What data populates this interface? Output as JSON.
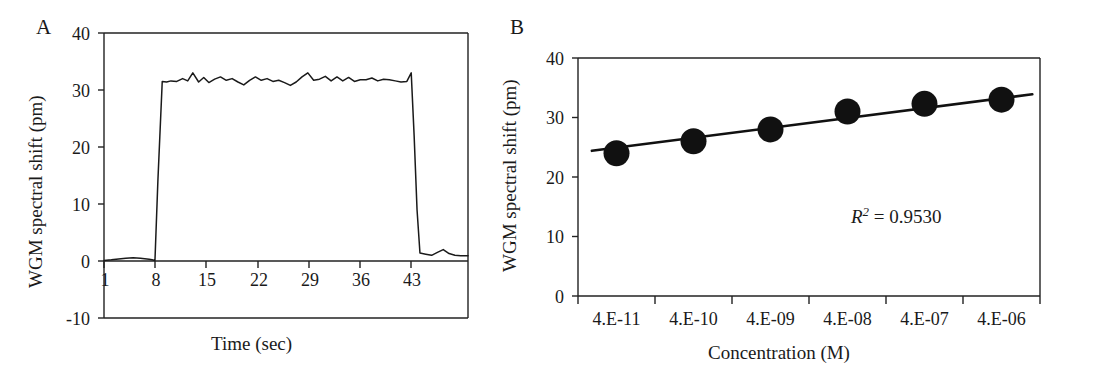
{
  "figure": {
    "panels": [
      {
        "letter": "A",
        "ylabel": "WGM spectral shift (pm)",
        "xlabel": "Time (sec)"
      },
      {
        "letter": "B",
        "ylabel": "WGM spectral shift (pm)",
        "xlabel": "Concentration (M)",
        "annotation_r": "R",
        "annotation_exp": "2",
        "annotation_eq": " = 0.9530"
      }
    ]
  },
  "chart_data": [
    {
      "type": "line",
      "title": "",
      "panel": "A",
      "xlabel": "Time (sec)",
      "ylabel": "WGM spectral shift (pm)",
      "xlim": [
        1,
        51
      ],
      "ylim": [
        -10,
        40
      ],
      "xticks": [
        1,
        8,
        15,
        22,
        29,
        36,
        43
      ],
      "xtick_labels": [
        "1",
        "8",
        "15",
        "22",
        "29",
        "36",
        "43"
      ],
      "yticks": [
        -10,
        0,
        10,
        20,
        30,
        40
      ],
      "ytick_labels": [
        "-10",
        "0",
        "10",
        "20",
        "30",
        "40"
      ],
      "grid": false,
      "legend": "none",
      "x": [
        1,
        2,
        3,
        4,
        5,
        6,
        6.6,
        7.2,
        7.6,
        8.0,
        8.4,
        9.0,
        9.6,
        10.2,
        11,
        11.8,
        12.5,
        13.2,
        14,
        14.7,
        15.4,
        16.2,
        17,
        17.8,
        18.6,
        19.4,
        20.2,
        21,
        21.8,
        22.6,
        23.4,
        24.2,
        25,
        25.8,
        26.6,
        27.4,
        28.2,
        29,
        29.8,
        30.6,
        31.4,
        32.2,
        33,
        33.8,
        34.6,
        35.4,
        36.2,
        37,
        37.8,
        38.6,
        39.4,
        40.2,
        41,
        41.8,
        42.6,
        43.2,
        43.6,
        44.0,
        44.4,
        45.2,
        46,
        46.8,
        47.6,
        48.4,
        49.2,
        50,
        51
      ],
      "y": [
        0.1,
        0.2,
        0.35,
        0.5,
        0.55,
        0.5,
        0.4,
        0.3,
        0.2,
        0.1,
        14,
        31.5,
        31.4,
        31.6,
        31.5,
        32.0,
        31.6,
        33.0,
        31.4,
        32.2,
        31.3,
        31.9,
        32.3,
        31.7,
        32.0,
        31.4,
        30.9,
        31.7,
        32.3,
        31.7,
        32.0,
        31.5,
        31.7,
        31.3,
        30.8,
        31.4,
        32.3,
        33.0,
        31.7,
        31.9,
        32.4,
        31.6,
        32.3,
        31.6,
        32.2,
        31.5,
        31.8,
        31.8,
        32.1,
        31.6,
        31.9,
        31.8,
        31.6,
        31.4,
        31.5,
        33.0,
        22,
        9,
        1.4,
        1.2,
        1.0,
        1.5,
        2.0,
        1.3,
        1.0,
        0.9,
        0.9
      ],
      "description": "Real-time WGM spectral shift response: flat baseline near 0 pm until t=8 s, sharp rise to ~32 pm plateau with small fluctuations, sharp drop back near 1 pm after t=43 s"
    },
    {
      "type": "scatter",
      "panel": "B",
      "title": "",
      "xlabel": "Concentration (M)",
      "ylabel": "WGM spectral shift (pm)",
      "ylim": [
        0,
        40
      ],
      "yticks": [
        0,
        10,
        20,
        30,
        40
      ],
      "ytick_labels": [
        "0",
        "10",
        "20",
        "30",
        "40"
      ],
      "xtick_labels": [
        "4.E-11",
        "4.E-10",
        "4.E-09",
        "4.E-08",
        "4.E-07",
        "4.E-06"
      ],
      "categories": [
        "4.E-11",
        "4.E-10",
        "4.E-09",
        "4.E-08",
        "4.E-07",
        "4.E-06"
      ],
      "values": [
        24,
        26,
        28,
        31,
        32.3,
        33
      ],
      "grid": false,
      "legend": "none",
      "trendline": {
        "x_start_value": 24.4,
        "x_end_value": 33.9,
        "label": "linear fit"
      },
      "r_squared": 0.953,
      "annotation": "R2 = 0.9530",
      "description": "Calibration curve of WGM spectral shift vs concentration on a log scale, rising linearly from 24 pm at 4E-11 M to 33 pm at 4E-06 M"
    }
  ]
}
